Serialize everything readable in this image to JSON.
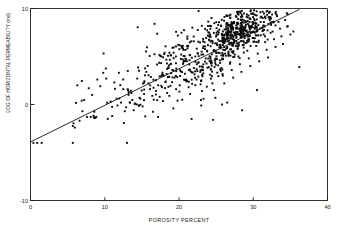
{
  "chart_data": {
    "type": "scatter",
    "title": "",
    "xlabel": "POROSITY PERCENT",
    "ylabel": "LOG OF HORIZONTAL PERMEABILITY (md)",
    "xlim": [
      0,
      40
    ],
    "ylim": [
      -10,
      10
    ],
    "xticks": [
      0,
      10,
      20,
      30,
      40
    ],
    "xticklabels": [
      "0",
      "10",
      "20",
      "30",
      "40"
    ],
    "yticks": [
      -10,
      0,
      10
    ],
    "yticklabels": [
      "-10",
      "0",
      "10"
    ],
    "grid": false,
    "legend": null,
    "marker": "square",
    "marker_color": "#0a0a0a",
    "marker_size_px": 1.9,
    "n_points": 820,
    "trendline": {
      "type": "linear-regression",
      "color": "#111111",
      "x_start": 0.0,
      "y_start": -3.9,
      "x_end": 36.2,
      "y_end": 9.9,
      "slope": 0.381,
      "intercept": -3.9
    },
    "annotations": [],
    "points": [
      [
        0.4,
        -4.0
      ],
      [
        0.9,
        -4.0
      ],
      [
        1.5,
        -4.0
      ],
      [
        5.7,
        -4.0
      ],
      [
        13.0,
        -4.0
      ],
      [
        6.3,
        2.0
      ],
      [
        6.9,
        0.4
      ],
      [
        7.0,
        -0.7
      ],
      [
        7.6,
        -1.3
      ],
      [
        8.1,
        -1.3
      ],
      [
        8.6,
        -1.4
      ],
      [
        8.3,
        1.0
      ],
      [
        9.0,
        2.6
      ],
      [
        9.4,
        1.9
      ],
      [
        9.8,
        3.3
      ],
      [
        10.2,
        2.7
      ],
      [
        10.4,
        -1.5
      ],
      [
        10.8,
        0.3
      ],
      [
        11.0,
        -1.2
      ],
      [
        11.3,
        2.3
      ],
      [
        11.6,
        0.6
      ],
      [
        11.9,
        3.3
      ],
      [
        12.2,
        0.2
      ],
      [
        12.5,
        1.6
      ],
      [
        12.7,
        -0.7
      ],
      [
        13.1,
        3.5
      ],
      [
        13.4,
        0.2
      ],
      [
        13.6,
        1.2
      ],
      [
        13.9,
        -0.6
      ],
      [
        14.1,
        0.1
      ],
      [
        14.3,
        0.0
      ],
      [
        14.6,
        -0.1
      ],
      [
        14.8,
        0.6
      ],
      [
        15.1,
        -0.2
      ],
      [
        15.3,
        1.1
      ],
      [
        15.6,
        3.4
      ],
      [
        15.9,
        2.2
      ],
      [
        16.1,
        1.6
      ],
      [
        16.4,
        0.9
      ],
      [
        16.6,
        0.5
      ],
      [
        16.9,
        1.4
      ],
      [
        17.2,
        2.0
      ],
      [
        17.4,
        0.8
      ],
      [
        17.7,
        1.8
      ],
      [
        17.9,
        3.0
      ],
      [
        18.2,
        2.4
      ],
      [
        18.4,
        1.2
      ],
      [
        18.7,
        0.9
      ],
      [
        18.9,
        4.2
      ],
      [
        19.1,
        3.6
      ],
      [
        19.4,
        2.8
      ],
      [
        19.6,
        1.6
      ],
      [
        19.8,
        0.4
      ],
      [
        20.1,
        2.0
      ],
      [
        20.3,
        5.2
      ],
      [
        20.6,
        4.4
      ],
      [
        20.8,
        3.2
      ],
      [
        21.0,
        2.4
      ],
      [
        21.3,
        1.8
      ],
      [
        21.5,
        1.1
      ],
      [
        21.7,
        -1.5
      ],
      [
        22.0,
        3.8
      ],
      [
        22.2,
        5.0
      ],
      [
        22.4,
        4.2
      ],
      [
        22.6,
        2.9
      ],
      [
        22.9,
        2.1
      ],
      [
        23.1,
        1.4
      ],
      [
        23.3,
        0.6
      ],
      [
        23.6,
        4.8
      ],
      [
        23.8,
        5.6
      ],
      [
        24.0,
        3.9
      ],
      [
        24.2,
        3.1
      ],
      [
        24.5,
        2.2
      ],
      [
        24.7,
        1.5
      ],
      [
        24.9,
        0.7
      ],
      [
        24.6,
        -1.6
      ],
      [
        25.1,
        6.2
      ],
      [
        25.3,
        5.4
      ],
      [
        25.5,
        4.6
      ],
      [
        25.7,
        3.8
      ],
      [
        25.9,
        3.0
      ],
      [
        26.1,
        2.2
      ],
      [
        26.3,
        6.8
      ],
      [
        26.5,
        6.0
      ],
      [
        26.7,
        5.2
      ],
      [
        26.9,
        4.4
      ],
      [
        27.1,
        3.6
      ],
      [
        27.3,
        2.8
      ],
      [
        27.5,
        7.2
      ],
      [
        27.7,
        6.6
      ],
      [
        27.9,
        5.8
      ],
      [
        28.0,
        5.0
      ],
      [
        28.2,
        4.2
      ],
      [
        28.4,
        3.4
      ],
      [
        28.6,
        7.8
      ],
      [
        28.8,
        7.1
      ],
      [
        29.0,
        6.4
      ],
      [
        29.2,
        5.6
      ],
      [
        29.4,
        4.8
      ],
      [
        29.6,
        4.0
      ],
      [
        29.8,
        8.2
      ],
      [
        30.0,
        7.6
      ],
      [
        30.2,
        6.9
      ],
      [
        30.4,
        6.1
      ],
      [
        30.6,
        5.3
      ],
      [
        30.8,
        4.5
      ],
      [
        31.0,
        8.6
      ],
      [
        31.2,
        8.0
      ],
      [
        31.4,
        7.3
      ],
      [
        31.6,
        6.5
      ],
      [
        31.8,
        5.7
      ],
      [
        32.0,
        4.9
      ],
      [
        32.2,
        8.9
      ],
      [
        32.4,
        8.3
      ],
      [
        32.6,
        7.6
      ],
      [
        32.8,
        6.8
      ],
      [
        33.0,
        6.0
      ],
      [
        33.2,
        9.2
      ],
      [
        33.4,
        8.6
      ],
      [
        33.6,
        7.9
      ],
      [
        33.8,
        7.1
      ],
      [
        34.0,
        6.3
      ],
      [
        34.3,
        8.8
      ],
      [
        34.6,
        8.1
      ],
      [
        35.0,
        7.3
      ],
      [
        35.4,
        7.6
      ],
      [
        36.2,
        3.9
      ],
      [
        30.5,
        1.5
      ],
      [
        28.5,
        -0.6
      ],
      [
        26.5,
        0.2
      ],
      [
        25.8,
        0.0
      ],
      [
        23.0,
        -0.1
      ]
    ]
  }
}
